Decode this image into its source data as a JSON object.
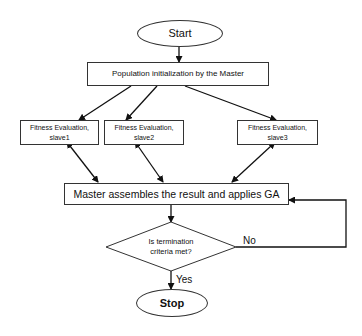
{
  "diagram": {
    "type": "flowchart",
    "title": "",
    "nodes": {
      "start": {
        "label": "Start",
        "shape": "ellipse"
      },
      "init": {
        "label": "Population initialization by the Master",
        "shape": "rect"
      },
      "slave1": {
        "line1": "Fitness Evaluation,",
        "line2": "slave1",
        "shape": "rect"
      },
      "slave2": {
        "line1": "Fitness Evaluation,",
        "line2": "slave2",
        "shape": "rect"
      },
      "slave3": {
        "line1": "Fitness Evaluation,",
        "line2": "slave3",
        "shape": "rect"
      },
      "master": {
        "label": "Master assembles the result and applies GA",
        "shape": "rect"
      },
      "decision": {
        "line1": "Is termination",
        "line2": "criteria met?",
        "shape": "diamond"
      },
      "stop": {
        "label": "Stop",
        "shape": "ellipse"
      }
    },
    "edges": [
      {
        "from": "start",
        "to": "init",
        "label": ""
      },
      {
        "from": "init",
        "to": "slave1",
        "label": ""
      },
      {
        "from": "init",
        "to": "slave2",
        "label": ""
      },
      {
        "from": "init",
        "to": "slave3",
        "label": ""
      },
      {
        "from": "slave1",
        "to": "master",
        "label": "",
        "bidirectional": true
      },
      {
        "from": "slave2",
        "to": "master",
        "label": "",
        "bidirectional": true
      },
      {
        "from": "slave3",
        "to": "master",
        "label": "",
        "bidirectional": true
      },
      {
        "from": "master",
        "to": "decision",
        "label": ""
      },
      {
        "from": "decision",
        "to": "master",
        "label": "No"
      },
      {
        "from": "decision",
        "to": "stop",
        "label": "Yes"
      }
    ],
    "edge_labels": {
      "no": "No",
      "yes": "Yes"
    }
  }
}
